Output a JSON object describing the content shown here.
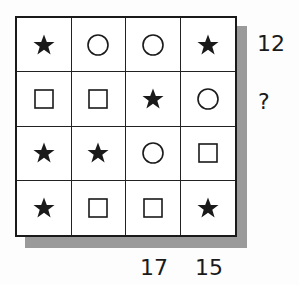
{
  "puzzle": {
    "grid": [
      [
        "star",
        "circle",
        "circle",
        "star"
      ],
      [
        "square",
        "square",
        "star",
        "circle"
      ],
      [
        "star",
        "star",
        "circle",
        "square"
      ],
      [
        "star",
        "square",
        "square",
        "star"
      ]
    ],
    "row_totals": [
      "12",
      "?",
      "",
      ""
    ],
    "column_totals": [
      "",
      "",
      "17",
      "15"
    ]
  },
  "colors": {
    "ink": "#1a1a1a",
    "shadow": "#9a9a9a",
    "background": "#ffffff"
  }
}
